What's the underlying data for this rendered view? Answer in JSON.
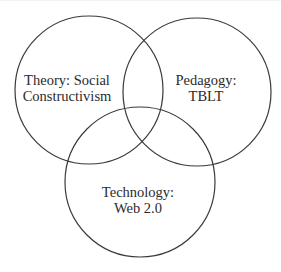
{
  "diagram": {
    "type": "venn",
    "stroke_color": "#3a3a3a",
    "text_color": "#2b2b2b",
    "background_color": "#ffffff",
    "sets": [
      {
        "id": "theory",
        "lines": [
          "Theory: Social",
          "Constructivism"
        ],
        "label": "Theory: Social Constructivism",
        "circle": {
          "cx": 89,
          "cy": 90,
          "r": 74
        }
      },
      {
        "id": "pedagogy",
        "lines": [
          "Pedagogy:",
          "TBLT"
        ],
        "label": "Pedagogy: TBLT",
        "circle": {
          "cx": 197,
          "cy": 92,
          "r": 74
        }
      },
      {
        "id": "technology",
        "lines": [
          "Technology:",
          "Web 2.0"
        ],
        "label": "Technology: Web 2.0",
        "circle": {
          "cx": 140,
          "cy": 182,
          "r": 75
        }
      }
    ]
  }
}
